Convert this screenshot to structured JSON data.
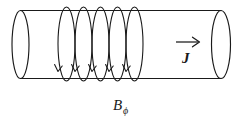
{
  "figure": {
    "background_color": "#ffffff",
    "ink_color": "#1a1a1a"
  },
  "labels": {
    "magnetic_field": {
      "symbol": "B",
      "subscript": "ϕ",
      "full": "Bϕ",
      "x": 113,
      "y": 110
    },
    "current_density": {
      "symbol": "J",
      "full": "J",
      "vector_arrow": "→",
      "x": 182,
      "y": 63
    }
  },
  "cylinder": {
    "name": "conductor-cylinder",
    "left_cap_center_x": 20.5,
    "right_cap_center_x": 221,
    "cap_radius_x": 8.5,
    "cap_radius_y": 34,
    "top_line_y": 10.5,
    "bottom_line_y": 78.5,
    "body_left_x": 20.5,
    "body_right_x": 221
  },
  "field_loops": {
    "name": "azimuthal-field-loops",
    "count": 5,
    "centers_x": [
      66.5,
      83.5,
      100.5,
      117.5,
      134.5
    ],
    "radius_x": 8.5,
    "radius_y": 37,
    "center_y": 44,
    "arrow_direction": "downward-front",
    "arrow_y": 70
  },
  "current_vector": {
    "name": "current-density-vector",
    "shaft_x1": 176,
    "shaft_x2": 199,
    "shaft_y": 42,
    "direction": "right"
  }
}
